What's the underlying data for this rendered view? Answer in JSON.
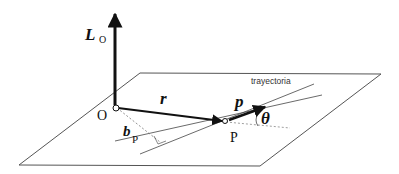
{
  "diagram": {
    "labels": {
      "angular_momentum": "L",
      "angular_momentum_sub": "O",
      "origin": "O",
      "position_vector": "r",
      "momentum": "p",
      "point": "P",
      "impact_parameter": "b",
      "impact_parameter_sub": "P",
      "angle": "θ",
      "trajectory": "trayectoria"
    },
    "colors": {
      "line": "#111111",
      "plane": "#555555",
      "dashed": "#777777",
      "background": "#ffffff"
    }
  }
}
